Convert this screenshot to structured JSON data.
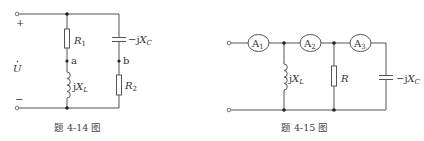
{
  "figures": [
    {
      "caption": "题 4-14 图",
      "source": {
        "label": "U",
        "plus": "+",
        "minus": "−"
      },
      "left_branch": {
        "resistor": {
          "label": "R",
          "sub": "1"
        },
        "node": "a",
        "inductor": {
          "prefix": "j",
          "label": "X",
          "sub": "L"
        }
      },
      "right_branch": {
        "capacitor": {
          "prefix": "−j",
          "label": "X",
          "sub": "C"
        },
        "node": "b",
        "resistor": {
          "label": "R",
          "sub": "2"
        }
      }
    },
    {
      "caption": "题 4-15 图",
      "ammeters": [
        {
          "label": "A",
          "sub": "1"
        },
        {
          "label": "A",
          "sub": "2"
        },
        {
          "label": "A",
          "sub": "3"
        }
      ],
      "inductor": {
        "prefix": "j",
        "label": "X",
        "sub": "L"
      },
      "resistor": {
        "label": "R"
      },
      "capacitor": {
        "prefix": "−j",
        "label": "X",
        "sub": "C"
      }
    }
  ],
  "colors": {
    "wire": "#555555",
    "node": "#222222",
    "text": "#333333",
    "background": "#ffffff"
  }
}
